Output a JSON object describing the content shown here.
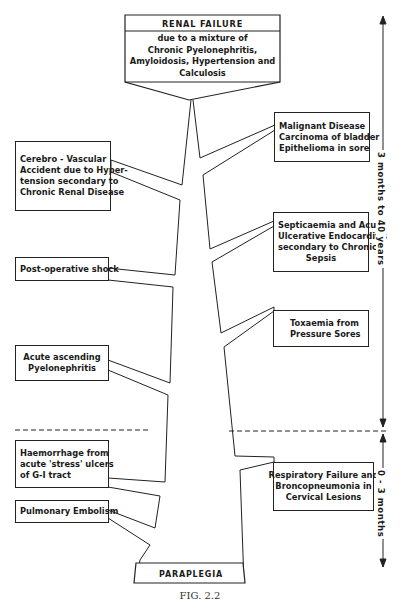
{
  "diagram": {
    "top": {
      "title": "RENAL FAILURE",
      "lines": [
        "due to a mixture of",
        "Chronic Pyelonephritis,",
        "Amyloidosis, Hypertension and",
        "Calculosis"
      ]
    },
    "bottom": {
      "label": "PARAPLEGIA"
    },
    "left_boxes": [
      {
        "id": "cva",
        "lines": [
          "Cerebro - Vascular",
          "Accident due to Hyper-",
          "tension secondary to",
          "Chronic Renal Disease"
        ]
      },
      {
        "id": "shock",
        "lines": [
          "Post-operative shock"
        ]
      },
      {
        "id": "pyelo",
        "lines": [
          "Acute ascending",
          "Pyelonephritis"
        ]
      },
      {
        "id": "haem",
        "lines": [
          "Haemorrhage from",
          "acute 'stress' ulcers",
          "of G-I tract"
        ]
      },
      {
        "id": "pe",
        "lines": [
          "Pulmonary Embolism"
        ]
      }
    ],
    "right_boxes": [
      {
        "id": "malig",
        "lines": [
          "Malignant Disease",
          "Carcinoma of bladder",
          "Epithelioma in sore"
        ]
      },
      {
        "id": "sept",
        "lines": [
          "Septicaemia and Acute",
          "Ulcerative Endocarditis",
          "secondary to Chronic",
          "Sepsis"
        ]
      },
      {
        "id": "tox",
        "lines": [
          "Toxaemia from",
          "Pressure Sores"
        ]
      },
      {
        "id": "resp",
        "lines": [
          "Respiratory Failure and",
          "Broncopneumonia in",
          "Cervical Lesions"
        ]
      }
    ],
    "timeline": {
      "upper": "3 months to 40 years",
      "lower": "0 - 3 months"
    },
    "caption": "FIG. 2.2"
  }
}
